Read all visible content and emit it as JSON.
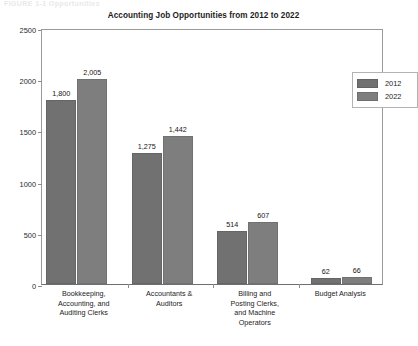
{
  "figure": {
    "caption": "FIGURE 1-1   Opportunities"
  },
  "chart_data": {
    "type": "bar",
    "title": "Accounting Job Opportunities from 2012 to 2022",
    "xlabel": "",
    "ylabel": "Thousand",
    "ylim": [
      0,
      2500
    ],
    "yticks": [
      "0",
      "500",
      "1000",
      "1500",
      "2000",
      "2500"
    ],
    "grid": false,
    "legend_position": "top-right",
    "categories": [
      "Bookkeeping, Accounting, and Auditing Clerks",
      "Accountants & Auditors",
      "Billing and Posting Clerks, and Machine Operators",
      "Budget Analysis"
    ],
    "category_lines": [
      [
        "Bookkeeping,",
        "Accounting, and",
        "Auditing Clerks"
      ],
      [
        "Accountants &",
        "Auditors"
      ],
      [
        "Billing and",
        "Posting Clerks,",
        "and Machine",
        "Operators"
      ],
      [
        "Budget Analysis"
      ]
    ],
    "series": [
      {
        "name": "2012",
        "color": "#717171",
        "values": [
          1800,
          1275,
          514,
          62
        ],
        "labels": [
          "1,800",
          "1,275",
          "514",
          "62"
        ]
      },
      {
        "name": "2022",
        "color": "#7e7e7e",
        "values": [
          2005,
          1442,
          607,
          66
        ],
        "labels": [
          "2,005",
          "1,442",
          "607",
          "66"
        ]
      }
    ]
  },
  "legend": {
    "entries": [
      {
        "label": "2012"
      },
      {
        "label": "2022"
      }
    ]
  }
}
